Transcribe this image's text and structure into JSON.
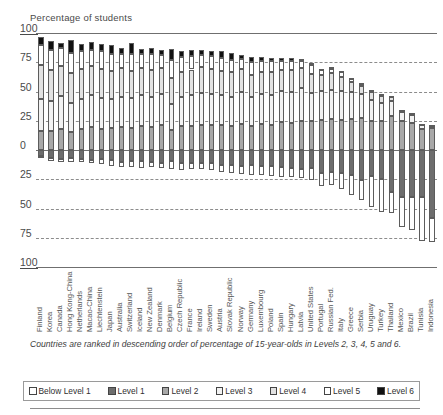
{
  "axis_title": "Percentage of students",
  "note": "Countries are ranked in descending order of percentage of 15-year-olds in Levels 2, 3, 4, 5 and 6.",
  "y_ticks": [
    "100",
    "75",
    "50",
    "25",
    "0",
    "25",
    "50",
    "75",
    "100"
  ],
  "legend": [
    {
      "label": "Below Level 1",
      "key": "below",
      "swatch": "white-open-square"
    },
    {
      "label": "Level 1",
      "key": "l1",
      "swatch": "dark-gray-square"
    },
    {
      "label": "Level 2",
      "key": "l2",
      "swatch": "mid-gray-square"
    },
    {
      "label": "Level 3",
      "key": "l3",
      "swatch": "light-dotted-square"
    },
    {
      "label": "Level 4",
      "key": "l4",
      "swatch": "dotted-square"
    },
    {
      "label": "Level 5",
      "key": "l5",
      "swatch": "white-open-square"
    },
    {
      "label": "Level 6",
      "key": "l6",
      "swatch": "black-square"
    }
  ],
  "colors": {
    "below": "#ffffff",
    "l1": "#6d6d6d",
    "l2": "#a8a8a8",
    "l3": "#f2f2f2",
    "l4": "#e2e2e2",
    "l5": "#ffffff",
    "l6": "#111111",
    "gridline": "#8c8c8c",
    "axis": "#5a5a5a",
    "text": "#4a4a4a"
  },
  "chart_data": {
    "type": "bar",
    "subtype": "diverging-stacked-bar",
    "title": "",
    "xlabel": "",
    "ylabel": "Percentage of students",
    "ylim": [
      -100,
      100
    ],
    "grid": true,
    "legend_position": "bottom",
    "stack_order_up": [
      "Level 2",
      "Level 3",
      "Level 4",
      "Level 5",
      "Level 6"
    ],
    "stack_order_down": [
      "Level 1",
      "Below Level 1"
    ],
    "categories": [
      "Finland",
      "Korea",
      "Canada",
      "Hong Kong-China",
      "Netherlands",
      "Macao-China",
      "Liechtenstein",
      "Japan",
      "Australia",
      "Switzerland",
      "Iceland",
      "New Zealand",
      "Denmark",
      "Belgium",
      "Czech Republic",
      "France",
      "Ireland",
      "Sweden",
      "Austria",
      "Slovak Republic",
      "Norway",
      "Germany",
      "Luxembourg",
      "Poland",
      "Spain",
      "Hungary",
      "Latvia",
      "United States",
      "Portugal",
      "Russian Fed.",
      "Italy",
      "Greece",
      "Serbia",
      "Uruguay",
      "Turkey",
      "Thailand",
      "Mexico",
      "Brazil",
      "Tunisia",
      "Indonesia"
    ],
    "series": [
      {
        "name": "Below Level 1",
        "values": [
          1.6,
          2.7,
          2.2,
          3.9,
          3.1,
          2.3,
          4.2,
          4.7,
          4.3,
          4.9,
          5.5,
          4.6,
          4.8,
          7.2,
          5.7,
          5.6,
          4.7,
          5.6,
          5.6,
          6.7,
          6.9,
          9.2,
          7.4,
          8.4,
          8.1,
          7.8,
          7.6,
          10.2,
          11.3,
          10.8,
          13.2,
          17.8,
          17.0,
          26.3,
          27.7,
          18.0,
          25.9,
          27.8,
          38.1,
          20.0
        ]
      },
      {
        "name": "Level 1",
        "values": [
          5.3,
          7.0,
          7.8,
          6.5,
          7.5,
          8.8,
          8.0,
          8.6,
          10.3,
          9.6,
          9.5,
          10.1,
          10.8,
          9.3,
          11.4,
          11.0,
          11.3,
          11.1,
          13.0,
          13.2,
          13.8,
          12.4,
          14.1,
          13.6,
          14.9,
          15.2,
          16.1,
          15.5,
          19.7,
          19.2,
          19.9,
          21.0,
          26.0,
          22.2,
          24.9,
          36.1,
          40.1,
          40.4,
          39.9,
          58.3
        ]
      },
      {
        "name": "Level 2",
        "values": [
          16.0,
          16.6,
          18.3,
          15.6,
          17.8,
          20.0,
          18.0,
          18.4,
          19.6,
          19.2,
          20.6,
          19.9,
          21.3,
          17.1,
          20.5,
          20.8,
          21.5,
          21.0,
          21.6,
          20.2,
          22.5,
          20.6,
          22.1,
          21.7,
          23.7,
          23.3,
          24.9,
          24.4,
          25.9,
          26.3,
          26.0,
          26.8,
          27.5,
          25.1,
          25.1,
          28.7,
          24.6,
          23.1,
          17.7,
          19.1
        ]
      },
      {
        "name": "Level 3",
        "values": [
          27.7,
          25.5,
          28.1,
          24.8,
          25.7,
          27.4,
          26.2,
          25.3,
          26.0,
          25.1,
          26.2,
          25.1,
          26.3,
          22.5,
          25.1,
          26.4,
          27.2,
          26.5,
          25.3,
          25.3,
          27.2,
          24.4,
          25.9,
          25.5,
          27.1,
          26.5,
          28.2,
          24.3,
          24.9,
          25.3,
          24.4,
          22.7,
          20.4,
          17.9,
          14.9,
          13.4,
          8.2,
          7.2,
          3.8,
          2.4
        ]
      },
      {
        "name": "Level 4",
        "values": [
          29.1,
          26.2,
          25.8,
          25.1,
          25.5,
          24.4,
          25.4,
          23.5,
          24.2,
          23.5,
          23.6,
          23.7,
          22.8,
          22.1,
          21.4,
          21.6,
          22.3,
          21.4,
          21.0,
          20.8,
          19.9,
          19.3,
          19.0,
          19.1,
          17.8,
          18.2,
          16.9,
          16.2,
          13.6,
          13.8,
          12.3,
          8.9,
          7.1,
          6.6,
          5.8,
          3.3,
          1.1,
          1.3,
          0.4,
          0.2
        ]
      },
      {
        "name": "Level 5",
        "values": [
          16.7,
          17.1,
          14.6,
          17.5,
          15.9,
          13.4,
          15.2,
          14.6,
          12.1,
          14.0,
          11.4,
          13.0,
          11.2,
          15.0,
          12.1,
          11.6,
          10.3,
          11.5,
          10.6,
          10.8,
          8.3,
          10.6,
          9.2,
          9.4,
          7.5,
          7.9,
          5.7,
          7.4,
          4.2,
          4.2,
          3.7,
          2.5,
          1.8,
          1.7,
          1.5,
          0.5,
          0.2,
          0.2,
          0.1,
          0.0
        ]
      },
      {
        "name": "Level 6",
        "values": [
          6.7,
          8.1,
          4.4,
          10.6,
          5.4,
          7.3,
          6.2,
          8.2,
          5.6,
          9.6,
          4.1,
          5.7,
          4.1,
          9.3,
          5.5,
          5.2,
          4.0,
          3.9,
          5.7,
          5.8,
          3.3,
          4.5,
          3.3,
          2.9,
          2.6,
          2.6,
          2.2,
          2.0,
          0.8,
          1.6,
          1.5,
          0.6,
          0.3,
          0.2,
          0.2,
          0.1,
          0.0,
          0.0,
          0.0,
          0.0
        ]
      }
    ]
  }
}
